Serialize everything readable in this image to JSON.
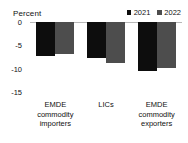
{
  "chart_data": {
    "type": "bar",
    "title": "",
    "ylabel": "Percent",
    "xlabel": "",
    "ylim": [
      -15,
      0
    ],
    "yticks": [
      0,
      -5,
      -10,
      -15
    ],
    "ytick_labels": [
      "0",
      "-5",
      "-10",
      "-15"
    ],
    "grid": false,
    "legend_position": "top-right",
    "categories": [
      "EMDE commodity importers",
      "LICs",
      "EMDE commodity exporters"
    ],
    "category_lines": [
      [
        "EMDE",
        "commodity",
        "importers"
      ],
      [
        "LICs",
        "",
        ""
      ],
      [
        "EMDE",
        "commodity",
        "exporters"
      ]
    ],
    "series": [
      {
        "name": "2021",
        "color": "#0d0d0d",
        "values": [
          -7.2,
          -7.8,
          -10.4
        ]
      },
      {
        "name": "2022",
        "color": "#4d4d4d",
        "values": [
          -6.9,
          -8.8,
          -9.9
        ]
      }
    ]
  },
  "legend": {
    "items": [
      {
        "label": "2021",
        "color": "#0d0d0d"
      },
      {
        "label": "2022",
        "color": "#4d4d4d"
      }
    ]
  },
  "axis": {
    "ylabel": "Percent",
    "ticks": [
      "0",
      "-5",
      "-10",
      "-15"
    ]
  }
}
